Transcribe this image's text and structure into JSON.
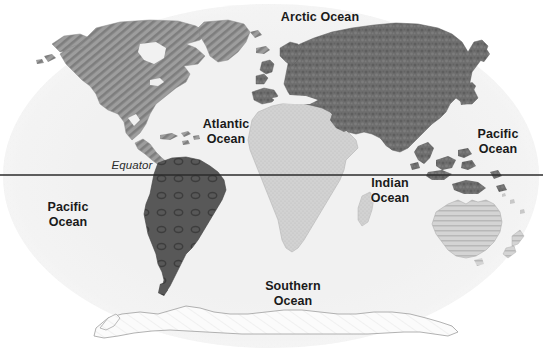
{
  "figure": {
    "kind": "world-map",
    "width": 543,
    "height": 353,
    "background_color": "#ffffff"
  },
  "colors": {
    "ocean_fill": "#f1f1f1",
    "ocean_edge": "#e4e4e4",
    "land_dark": "#585858",
    "land_medium": "#8f8f8f",
    "land_light": "#cfcfcf",
    "land_white": "#fbfbfb",
    "outline": "#9a9a9a",
    "equator_line": "#2b2b2b",
    "label_text": "#1a1a1a"
  },
  "equator": {
    "label": "Equator",
    "line_y": 175,
    "line_color": "#2b2b2b",
    "line_width": 1.4,
    "label_x": 97,
    "label_y": 158
  },
  "ocean_labels": [
    {
      "name": "arctic-ocean",
      "text": "Arctic Ocean",
      "x": 268,
      "y": 10,
      "width": 104,
      "lines": 1
    },
    {
      "name": "atlantic-ocean",
      "text": "Atlantic\nOcean",
      "x": 190,
      "y": 117,
      "width": 72,
      "lines": 2
    },
    {
      "name": "pacific-ocean-east",
      "text": "Pacific\nOcean",
      "x": 466,
      "y": 127,
      "width": 64,
      "lines": 2
    },
    {
      "name": "pacific-ocean-west",
      "text": "Pacific\nOcean",
      "x": 36,
      "y": 200,
      "width": 64,
      "lines": 2
    },
    {
      "name": "indian-ocean",
      "text": "Indian\nOcean",
      "x": 358,
      "y": 176,
      "width": 64,
      "lines": 2
    },
    {
      "name": "southern-ocean",
      "text": "Southern\nOcean",
      "x": 252,
      "y": 279,
      "width": 82,
      "lines": 2
    }
  ],
  "continents": [
    {
      "name": "north-america",
      "label": "North America",
      "fill": "#8f8f8f",
      "pattern": "diagonal-hatch"
    },
    {
      "name": "greenland",
      "label": "Greenland",
      "fill": "#8f8f8f",
      "pattern": "diagonal-hatch"
    },
    {
      "name": "south-america",
      "label": "South America",
      "fill": "#585858",
      "pattern": "rings"
    },
    {
      "name": "africa",
      "label": "Africa",
      "fill": "#cfcfcf",
      "pattern": "stipple"
    },
    {
      "name": "eurasia",
      "label": "Europe and Asia",
      "fill": "#6f6f6f",
      "pattern": "mottle"
    },
    {
      "name": "australia",
      "label": "Australia",
      "fill": "#cfcfcf",
      "pattern": "horizontal-hatch"
    },
    {
      "name": "antarctica",
      "label": "Antarctica",
      "fill": "#fbfbfb",
      "pattern": "outline-only"
    }
  ]
}
